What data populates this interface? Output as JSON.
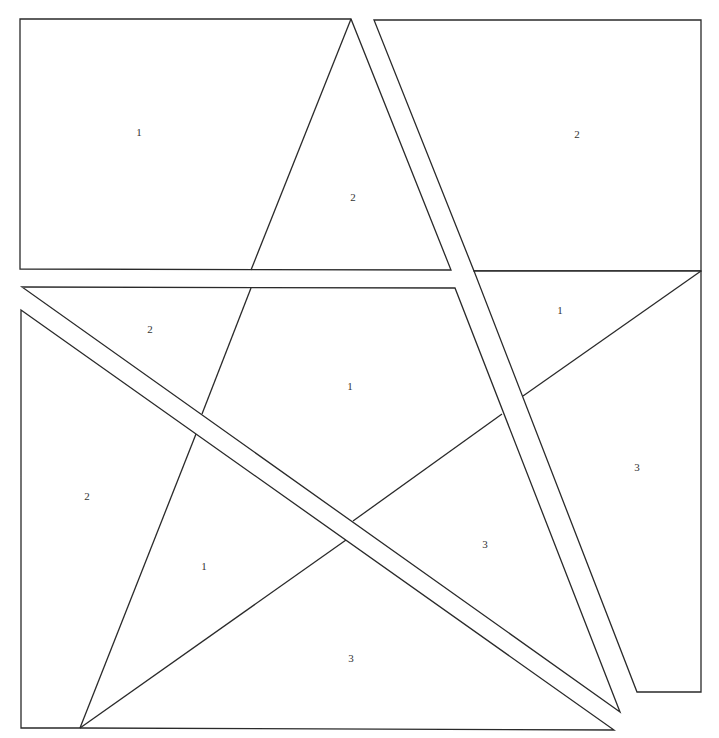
{
  "diagram": {
    "title": "",
    "stroke_color": "#2a2a2a",
    "background": "#ffffff",
    "pieces": [
      {
        "id": "top-left-rect",
        "points": "20,19 351,19 451,270 20,269"
      },
      {
        "id": "top-right-rect",
        "points": "374,20 701,20 701,271 474,271"
      },
      {
        "id": "right-column",
        "points": "474,271 701,271 701,692 637,692"
      },
      {
        "id": "center-band",
        "points": "22,287 455,288 620,712"
      },
      {
        "id": "lower-left",
        "points": "21,310 614,730 80,728 21,728"
      }
    ],
    "lines": [
      {
        "id": "star-left-edge-upper",
        "x1": 351,
        "y1": 19,
        "x2": 251,
        "y2": 270
      },
      {
        "id": "star-left-edge-mid",
        "x1": 251,
        "y1": 288,
        "x2": 202,
        "y2": 414
      },
      {
        "id": "star-left-edge-lower",
        "x1": 196,
        "y1": 434,
        "x2": 80,
        "y2": 728
      },
      {
        "id": "star-right-upper-edge",
        "x1": 701,
        "y1": 271,
        "x2": 523,
        "y2": 396
      },
      {
        "id": "star-right-mid-edge",
        "x1": 502,
        "y1": 414,
        "x2": 353,
        "y2": 521
      },
      {
        "id": "star-right-lower-edge",
        "x1": 346,
        "y1": 540,
        "x2": 80,
        "y2": 728
      }
    ],
    "labels": [
      {
        "id": "label-top-left",
        "text": "1",
        "x": 139,
        "y": 133
      },
      {
        "id": "label-top-star-tip",
        "text": "2",
        "x": 353,
        "y": 198
      },
      {
        "id": "label-top-right",
        "text": "2",
        "x": 577,
        "y": 135
      },
      {
        "id": "label-mid-left",
        "text": "2",
        "x": 150,
        "y": 330
      },
      {
        "id": "label-center",
        "text": "1",
        "x": 350,
        "y": 387
      },
      {
        "id": "label-right-triangle",
        "text": "1",
        "x": 560,
        "y": 311
      },
      {
        "id": "label-left-column",
        "text": "2",
        "x": 87,
        "y": 497
      },
      {
        "id": "label-lower-left-star",
        "text": "1",
        "x": 204,
        "y": 567
      },
      {
        "id": "label-lower-center",
        "text": "3",
        "x": 485,
        "y": 545
      },
      {
        "id": "label-right-column",
        "text": "3",
        "x": 637,
        "y": 468
      },
      {
        "id": "label-bottom",
        "text": "3",
        "x": 351,
        "y": 659
      }
    ]
  }
}
